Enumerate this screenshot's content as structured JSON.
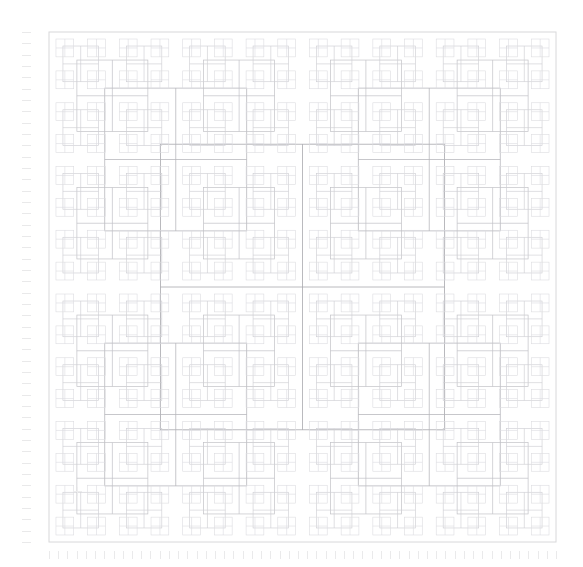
{
  "figure": {
    "title": "",
    "background_color": "#ffffff",
    "width": 583,
    "height": 567
  },
  "axes": {
    "x": {
      "label": "",
      "tick_labels": [],
      "tick_count": 56,
      "tick_color": "#eaeaeb",
      "range_px": [
        49,
        556
      ],
      "tick_row_y_px": 551,
      "tick_length_px": 8
    },
    "y": {
      "label": "",
      "tick_labels": [],
      "tick_count": 46,
      "tick_color": "#e9e9ea",
      "range_px": [
        32,
        542
      ],
      "tick_col_x_px": 22,
      "tick_length_px": 9
    }
  },
  "chart_data": {
    "type": "line",
    "title": "",
    "subtitle": "",
    "xlabel": "",
    "ylabel": "",
    "grid": false,
    "legend": null,
    "legend_position": "none",
    "xlim": [
      49,
      556
    ],
    "ylim": [
      32,
      542
    ],
    "stroke_colors": {
      "frame": "#d8d8da",
      "depth_1": "#a8a8ad",
      "depth_2": "#b4b4b9",
      "depth_3": "#c2c2c7",
      "depth_4": "#cfcfd4",
      "depth_5": "#dcdce0"
    },
    "stroke_width": 0.8,
    "recursion": {
      "levels": 5,
      "split_ratio": 0.5,
      "inset_ratio": 0.22,
      "root_rect_px": [
        49,
        32,
        507,
        510
      ]
    },
    "annotations": [
      {
        "name": "center-marker",
        "shape": "plus",
        "x_px": 77,
        "y_px": 491,
        "size_px": 9,
        "color": "#ededee"
      }
    ],
    "series": [
      {
        "name": "recursive-rectangles",
        "kind": "path-collection",
        "element_count": 341
      }
    ]
  }
}
